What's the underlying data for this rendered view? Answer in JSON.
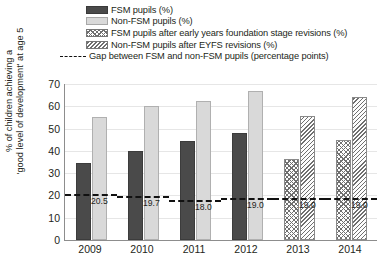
{
  "chart_data": {
    "type": "bar",
    "title": "",
    "xlabel": "",
    "ylabel_line1": "% of children achieving a",
    "ylabel_line2": "'good level of development' at age 5",
    "categories": [
      "2009",
      "2010",
      "2011",
      "2012",
      "2013",
      "2014"
    ],
    "ylim": [
      0,
      70
    ],
    "yticks": [
      "0",
      "10",
      "20",
      "30",
      "40",
      "50",
      "60",
      "70"
    ],
    "grid": true,
    "legend_position": "top",
    "series": [
      {
        "name": "FSM pupils (%)",
        "style": "solid-dark",
        "values": [
          34.5,
          40.0,
          44.5,
          48.0,
          null,
          null
        ]
      },
      {
        "name": "Non-FSM pupils (%)",
        "style": "solid-light",
        "values": [
          55.0,
          60.0,
          62.5,
          67.0,
          null,
          null
        ]
      },
      {
        "name": "FSM pupils after early years foundation stage revisions (%)",
        "style": "crosshatch",
        "values": [
          null,
          null,
          null,
          null,
          36.5,
          45.0
        ]
      },
      {
        "name": "Non-FSM pupils after EYFS revisions (%)",
        "style": "diagonal-hatch",
        "values": [
          null,
          null,
          null,
          null,
          55.5,
          64.0
        ]
      },
      {
        "name": "Gap between FSM and non-FSM pupils (percentage points)",
        "style": "dashed-line",
        "values": [
          20.5,
          19.7,
          18.0,
          19.0,
          19.0,
          19.0
        ],
        "labels": [
          "20.5",
          "19.7",
          "18.0",
          "19.0",
          "19.0",
          "19.0"
        ]
      }
    ]
  },
  "legend": {
    "items": [
      {
        "label": "FSM pupils (%)",
        "swatch": "solid-dark-swatch"
      },
      {
        "label": "Non-FSM pupils (%)",
        "swatch": "solid-light-swatch"
      },
      {
        "label": "FSM pupils after early years foundation stage revisions (%)",
        "swatch": "crosshatch-swatch"
      },
      {
        "label": "Non-FSM pupils after EYFS revisions (%)",
        "swatch": "diagonal-hatch-swatch"
      },
      {
        "label": "Gap between FSM and non-FSM pupils (percentage points)",
        "swatch": "dashed-line-swatch"
      }
    ]
  },
  "colors": {
    "fsm": "#4a4a4a",
    "non_fsm": "#d9d9d9",
    "hatch": "#6f6f6f",
    "gap_line": "#111111",
    "axis": "#8d8d8d",
    "grid": "#e6e6e6"
  }
}
